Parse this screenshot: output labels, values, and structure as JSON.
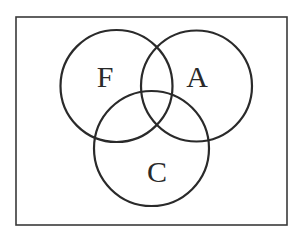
{
  "diagram": {
    "type": "venn",
    "universe": {
      "x": 16,
      "y": 17,
      "width": 271,
      "height": 208
    },
    "sets": [
      {
        "id": "F",
        "label": "F",
        "cx": 116.5,
        "cy": 86,
        "r": 56,
        "label_x": 105,
        "label_y": 87
      },
      {
        "id": "A",
        "label": "A",
        "cx": 196.5,
        "cy": 86,
        "r": 55.5,
        "label_x": 197,
        "label_y": 87
      },
      {
        "id": "C",
        "label": "C",
        "cx": 151.5,
        "cy": 148.5,
        "r": 57.5,
        "label_x": 157,
        "label_y": 182
      }
    ],
    "colors": {
      "stroke": "#2a2a2a",
      "frame": "#3a3a3a",
      "background": "#ffffff"
    }
  }
}
